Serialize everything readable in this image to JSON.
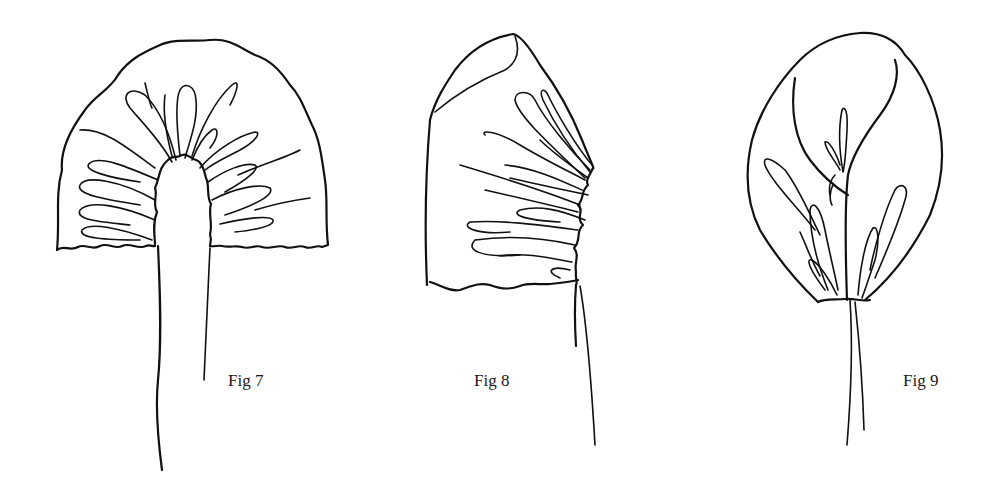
{
  "figures": [
    {
      "id": "fig7",
      "label": "Fig 7",
      "label_pos": {
        "x": 228,
        "y": 373
      }
    },
    {
      "id": "fig8",
      "label": "Fig 8",
      "label_pos": {
        "x": 474,
        "y": 373
      }
    },
    {
      "id": "fig9",
      "label": "Fig 9",
      "label_pos": {
        "x": 903,
        "y": 373
      }
    }
  ],
  "colors": {
    "ink": "#111111",
    "background": "#ffffff"
  }
}
